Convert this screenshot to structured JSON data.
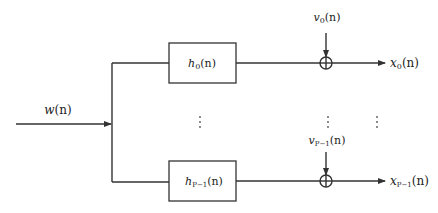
{
  "diagram": {
    "type": "block-diagram",
    "input": {
      "label": "w",
      "arg": "(n)"
    },
    "branches": [
      {
        "filter": {
          "label": "h",
          "sub": "0",
          "arg": "(n)"
        },
        "noise": {
          "label": "v",
          "sub": "0",
          "arg": "(n)"
        },
        "output": {
          "label": "x",
          "sub": "0",
          "arg": "(n)"
        },
        "adder_symbol": "⊕"
      },
      {
        "filter": {
          "label": "h",
          "sub": "P−1",
          "arg": "(n)"
        },
        "noise": {
          "label": "v",
          "sub": "P−1",
          "arg": "(n)"
        },
        "output": {
          "label": "x",
          "sub": "P−1",
          "arg": "(n)"
        },
        "adder_symbol": "⊕"
      }
    ],
    "ellipsis": "⋮",
    "colors": {
      "stroke": "#333333",
      "text": "#222222",
      "background": "#ffffff"
    }
  }
}
